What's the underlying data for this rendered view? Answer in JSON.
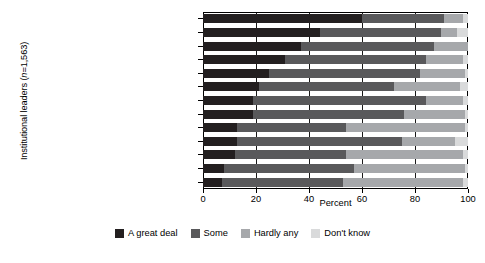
{
  "chart_data": {
    "type": "bar",
    "orientation": "horizontal",
    "stacked": true,
    "title": "",
    "xlabel": "Percent",
    "ylabel": "Institutional leaders (n=1,563)",
    "xlim": [
      0,
      100
    ],
    "xticks": [
      0,
      20,
      40,
      60,
      80,
      100
    ],
    "xtick_labels": [
      "0",
      "20",
      "40",
      "60",
      "80",
      "100"
    ],
    "grid": true,
    "legend_position": "bottom",
    "categories": [
      "Military",
      "Scientific community",
      "Medicine",
      "US Supreme Court",
      "Education",
      "Organized religion",
      "Major companies",
      "Banks & financial institutions",
      "Press",
      "Organized labor",
      "Executive branch of the federal gov.",
      "Television",
      "Congress"
    ],
    "series": [
      {
        "name": "A great deal",
        "color": "#231f20",
        "values": [
          60,
          44,
          37,
          31,
          25,
          21,
          19,
          19,
          13,
          13,
          12,
          8,
          7
        ]
      },
      {
        "name": "Some",
        "color": "#59595b",
        "values": [
          31,
          46,
          50,
          53,
          57,
          51,
          65,
          57,
          41,
          62,
          42,
          49,
          46
        ]
      },
      {
        "name": "Hardly any",
        "color": "#a6a8ab",
        "values": [
          7,
          6,
          13,
          14,
          17,
          25,
          14,
          23,
          45,
          20,
          44,
          42,
          45
        ]
      },
      {
        "name": "Don't know",
        "color": "#d9dadb",
        "values": [
          2,
          4,
          0,
          2,
          1,
          3,
          2,
          1,
          1,
          5,
          2,
          1,
          2
        ]
      }
    ]
  },
  "legend": {
    "items": [
      {
        "label": "A great deal",
        "color": "#231f20"
      },
      {
        "label": "Some",
        "color": "#59595b"
      },
      {
        "label": "Hardly any",
        "color": "#a6a8ab"
      },
      {
        "label": "Don't know",
        "color": "#d9dadb"
      }
    ]
  },
  "axes": {
    "x_title": "Percent",
    "y_title_prefix": "Institutional leaders (",
    "y_title_italic": "n",
    "y_title_suffix": "=1,563)"
  }
}
